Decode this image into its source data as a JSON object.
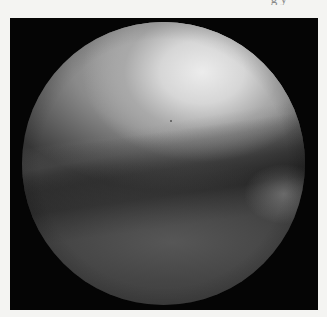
{
  "image": {
    "kind": "arthroscopic view",
    "description": "Grayscale circular endoscopic/arthroscopic view of a joint: bright curved articular surface at top, darker crease band across the middle, and lighter soft tissue (meniscus) along the bottom, inside a black square frame on a light page.",
    "colors": {
      "page_background": "#f4f4f2",
      "frame": "#050505",
      "highlight": "#ececec",
      "midtone": "#8a8a8a",
      "shadow": "#3a3a3a"
    }
  },
  "caption": {
    "top_fragment": "g y"
  }
}
